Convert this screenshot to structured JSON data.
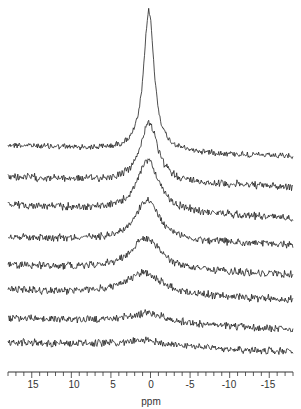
{
  "chart_data": {
    "type": "line",
    "title": "",
    "xlabel": "ppm",
    "ylabel": "",
    "xlim": [
      18,
      -18
    ],
    "x_reversed": true,
    "grid": false,
    "legend": null,
    "x_ticks": [
      15,
      10,
      5,
      0,
      -5,
      -10,
      -15
    ],
    "x_tick_labels": [
      "15",
      "10",
      "5",
      "0",
      "-5",
      "-10",
      "-15"
    ],
    "series": [
      {
        "name": "trace 1 (top)",
        "center_ppm": 0.2,
        "baseline_left_px": 145,
        "baseline_right_px": 157,
        "peak_height_px": 140,
        "width_ppm": 1.6
      },
      {
        "name": "trace 2",
        "center_ppm": 0.2,
        "baseline_left_px": 177,
        "baseline_right_px": 187,
        "peak_height_px": 60,
        "width_ppm": 2.6
      },
      {
        "name": "trace 3",
        "center_ppm": 0.3,
        "baseline_left_px": 205,
        "baseline_right_px": 218,
        "peak_height_px": 52,
        "width_ppm": 3.2
      },
      {
        "name": "trace 4",
        "center_ppm": 0.4,
        "baseline_left_px": 237,
        "baseline_right_px": 245,
        "peak_height_px": 40,
        "width_ppm": 3.8
      },
      {
        "name": "trace 5",
        "center_ppm": 0.6,
        "baseline_left_px": 265,
        "baseline_right_px": 275,
        "peak_height_px": 32,
        "width_ppm": 4.5
      },
      {
        "name": "trace 6",
        "center_ppm": 0.8,
        "baseline_left_px": 290,
        "baseline_right_px": 300,
        "peak_height_px": 22,
        "width_ppm": 5.5
      },
      {
        "name": "trace 7",
        "center_ppm": 0.5,
        "baseline_left_px": 318,
        "baseline_right_px": 330,
        "peak_height_px": 10,
        "width_ppm": 7
      },
      {
        "name": "trace 8 (bottom)",
        "center_ppm": 0.5,
        "baseline_left_px": 342,
        "baseline_right_px": 352,
        "peak_height_px": 6,
        "width_ppm": 8
      }
    ]
  },
  "axis": {
    "labels": [
      "15",
      "10",
      "5",
      "0",
      "-5",
      "-10",
      "-15"
    ],
    "title": "ppm"
  },
  "colors": {
    "trace": "#222222",
    "axis": "#333333",
    "background": "#ffffff"
  }
}
